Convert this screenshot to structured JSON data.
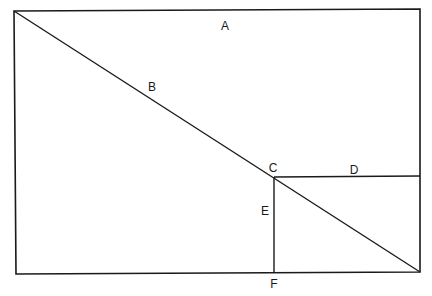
{
  "diagram": {
    "type": "geometric-figure",
    "stroke_color": "#1a1a1a",
    "background": "#ffffff",
    "labels": {
      "A": "A",
      "B": "B",
      "C": "C",
      "D": "D",
      "E": "E",
      "F": "F"
    },
    "label_positions": {
      "A": [
        225,
        26
      ],
      "B": [
        152,
        87
      ],
      "C": [
        273,
        168
      ],
      "D": [
        354,
        170
      ],
      "E": [
        265,
        211
      ],
      "F": [
        274,
        284
      ]
    },
    "lines": [
      {
        "name": "outer-rectangle",
        "points": [
          [
            14,
            11
          ],
          [
            420,
            9
          ],
          [
            420,
            272
          ],
          [
            16,
            274
          ]
        ]
      },
      {
        "name": "diagonal-B",
        "from": [
          14,
          11
        ],
        "to": [
          420,
          272
        ]
      },
      {
        "name": "segment-CD",
        "from": [
          274,
          177
        ],
        "to": [
          420,
          176
        ]
      },
      {
        "name": "segment-EF",
        "from": [
          274,
          177
        ],
        "to": [
          274,
          273
        ]
      }
    ]
  }
}
